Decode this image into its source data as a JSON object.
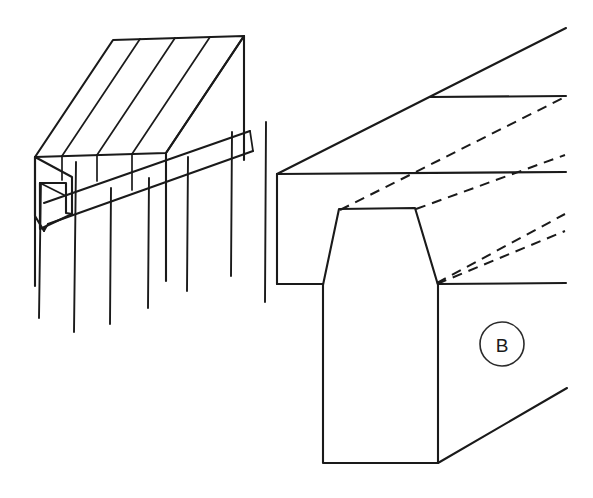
{
  "document": {
    "kind": "technical-line-drawing",
    "subject": "dovetail groove joint",
    "background_color": "#ffffff",
    "line_color": "#1a1a1a",
    "width": 593,
    "height": 498
  },
  "figures": [
    {
      "id": "left-figure",
      "name": "isometric-beam-view",
      "description": "Isometric view of a segmented rail with a longitudinal dovetail groove and a notched left end",
      "segment_count": 4,
      "break_line_count": 7
    },
    {
      "id": "right-figure",
      "name": "detail-view-b",
      "description": "Enlarged detail view of the dovetail groove profile with hidden edges shown dashed",
      "hidden_line_count": 4,
      "callout": "B"
    }
  ],
  "callouts": [
    {
      "label": "B",
      "name": "detail-callout-b",
      "cx": 502,
      "cy": 344,
      "r": 22
    }
  ],
  "geometry": {
    "left_figure": {
      "top_face": "M 35,157 L 113,40 L 244,36 L 166,153 Z",
      "front_face": "M 35,157 L 166,153 L 166,281 L 35,285 Z",
      "segment_dividers": [
        [
          "62,156",
          "140,39"
        ],
        [
          "97,155",
          "175,38"
        ],
        [
          "132,154",
          "210,37"
        ]
      ],
      "groove_upper": [
        "38,196",
        "246,128"
      ],
      "groove_lower": [
        "48,218",
        "250,146"
      ],
      "notch": [
        "40,182",
        "40,229",
        "72,214"
      ],
      "break_lines": [
        {
          "x": 40,
          "y1": 176,
          "y2": 318
        },
        {
          "x": 75,
          "y1": 160,
          "y2": 330
        },
        {
          "x": 110,
          "y1": 186,
          "y2": 322
        },
        {
          "x": 148,
          "y1": 176,
          "y2": 308
        },
        {
          "x": 187,
          "y1": 155,
          "y2": 290
        },
        {
          "x": 231,
          "y1": 130,
          "y2": 275
        },
        {
          "x": 265,
          "y1": 120,
          "y2": 300
        }
      ]
    },
    "right_figure": {
      "top_ridge": [
        "277,174",
        "565,28"
      ],
      "upper_horizontal": [
        "430,97",
        "565,96"
      ],
      "mid_horizontal": [
        "277,174",
        "565,172"
      ],
      "left_vertical": [
        "277,174",
        "277,284"
      ],
      "bottom_horizontal": [
        "277,284",
        "565,283"
      ],
      "dovetail": "M 323,284 L 338,209 L 415,208 L 438,284",
      "stem": "M 323,284 L 323,463 L 438,463 L 438,284",
      "bottom_diagonal": [
        "438,463",
        "567,388"
      ],
      "hidden_edges": [
        [
          "338,209",
          "565,96"
        ],
        [
          "415,208",
          "565,155"
        ],
        [
          "438,284",
          "565,213"
        ],
        [
          "438,284",
          "565,230"
        ]
      ]
    }
  }
}
